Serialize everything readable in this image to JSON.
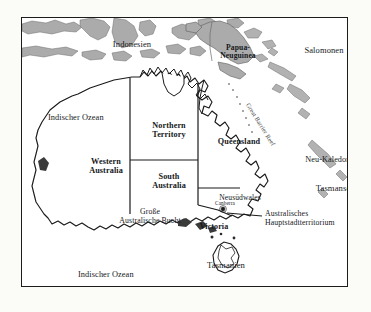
{
  "map": {
    "title_alt": "Australien",
    "frame": {
      "x": 21,
      "y": 17,
      "width": 327,
      "height": 270
    },
    "background_color": "#fbfbf8",
    "land_fill": "#ffffff",
    "island_fill": "#a9a9a9",
    "line_color": "#1c1c1c",
    "labels": {
      "indonesien": "Indonesien",
      "papua_neuguinea_line1": "Papua-",
      "papua_neuguinea_line2": "Neuguinea",
      "salomonen": "Salomonen",
      "neu_kaledonien": "Neu-Kaledonien",
      "tasmansee": "Tasmansee",
      "indischer_ozean_nord": "Indischer Ozean",
      "indischer_ozean_sued": "Indischer Ozean",
      "great_barrier_reef": "Great Barrier Reef",
      "western_australia_line1": "Western",
      "western_australia_line2": "Australia",
      "northern_territory_line1": "Northern",
      "northern_territory_line2": "Territory",
      "queensland": "Queensland",
      "south_australia_line1": "South",
      "south_australia_line2": "Australia",
      "neusuedwales": "Neusüdwales",
      "victoria": "Victoria",
      "tasmanien": "Tasmanien",
      "canberra": "Canberra",
      "grosse_australische_bucht_line1": "Große",
      "grosse_australische_bucht_line2": "Australische Bucht",
      "act_line1": "Australisches",
      "act_line2": "Hauptstadtterritorium"
    }
  }
}
